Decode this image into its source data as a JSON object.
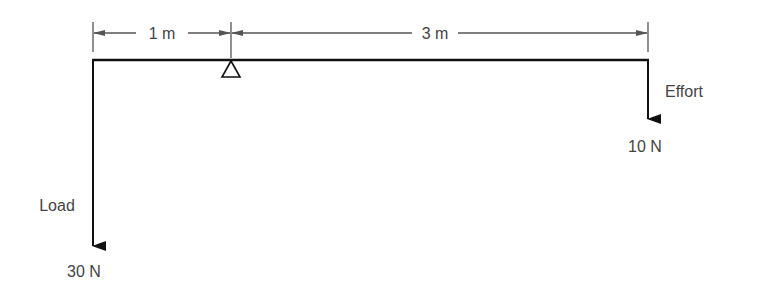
{
  "diagram": {
    "type": "lever",
    "dimensions": [
      {
        "label": "1 m",
        "from": "load",
        "to": "fulcrum"
      },
      {
        "label": "3 m",
        "from": "fulcrum",
        "to": "effort"
      }
    ],
    "load": {
      "label": "Load",
      "value": "30 N"
    },
    "effort": {
      "label": "Effort",
      "value": "10 N"
    },
    "fulcrum": {
      "symbol": "triangle"
    },
    "colors": {
      "line": "#111111",
      "dim": "#555555",
      "text": "#444444"
    }
  }
}
